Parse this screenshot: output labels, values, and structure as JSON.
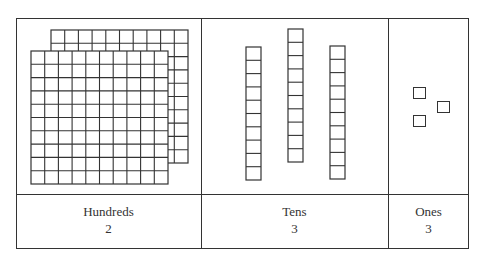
{
  "columns": [
    {
      "id": "hundreds",
      "label": "Hundreds",
      "count": "2",
      "block": "flat",
      "units_per_block": 100
    },
    {
      "id": "tens",
      "label": "Tens",
      "count": "3",
      "block": "rod",
      "units_per_block": 10
    },
    {
      "id": "ones",
      "label": "Ones",
      "count": "3",
      "block": "unit-cube",
      "units_per_block": 1
    }
  ],
  "colors": {
    "line": "#333333",
    "background": "#ffffff"
  }
}
